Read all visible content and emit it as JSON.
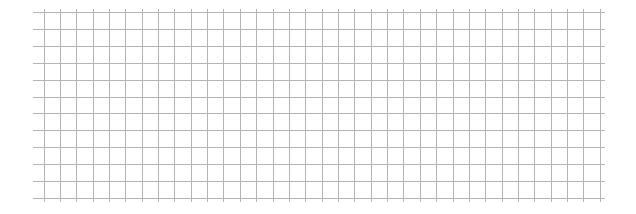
{
  "grid": {
    "line_color": "#b4b4b4",
    "background": "#ffffff",
    "horizontal": {
      "count": 12,
      "start_y": 12,
      "spacing": 16.9,
      "x_start": 33,
      "x_end": 605
    },
    "vertical": {
      "count": 35,
      "start_x": 43.5,
      "spacing": 16.36,
      "y_start": 9,
      "y_end": 202
    }
  }
}
